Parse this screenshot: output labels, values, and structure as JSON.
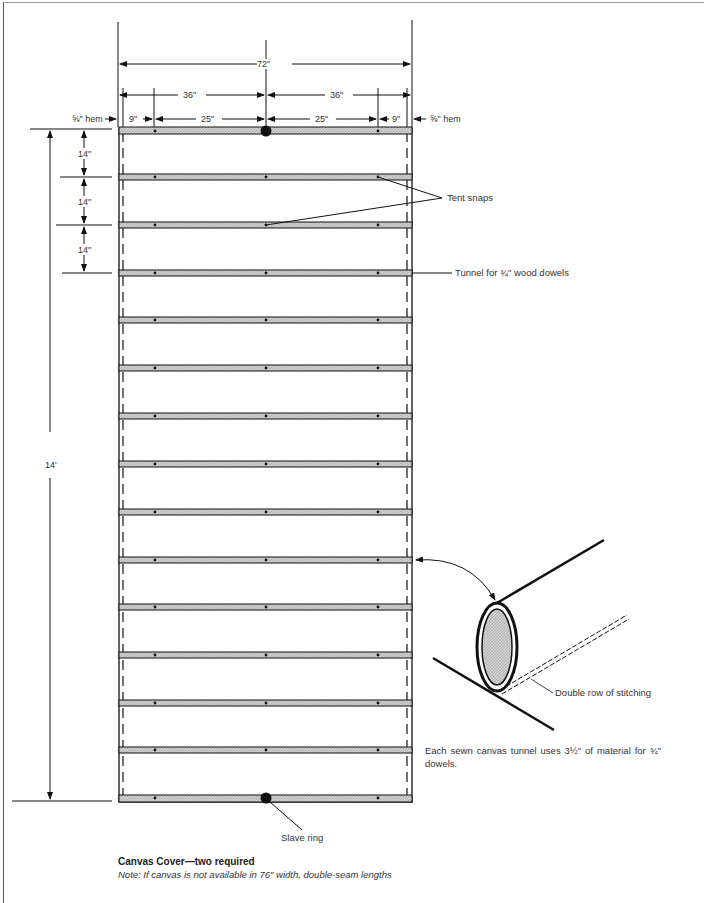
{
  "diagram": {
    "dimensions": {
      "total_width": "72\"",
      "half_left": "36\"",
      "half_right": "36\"",
      "seg_9_left": "9\"",
      "seg_25_left": "25\"",
      "seg_25_right": "25\"",
      "seg_9_right": "9\"",
      "hem_left": "⅝\" hem",
      "hem_right": "⅝\" hem",
      "spacing_1": "14\"",
      "spacing_2": "14\"",
      "spacing_3": "14\"",
      "total_length": "14'"
    },
    "callouts": {
      "tent_snaps": "Tent snaps",
      "tunnel": "Tunnel for ¾\" wood dowels",
      "stitching": "Double row of stitching",
      "slave_ring": "Slave ring"
    },
    "detail_note": "Each sewn canvas tunnel uses 3½\" of material for ¾\" dowels.",
    "tunnel_count": 15,
    "colors": {
      "line": "#111111",
      "tunnel_fill": "#c8c8c8",
      "paper": "#ffffff"
    }
  },
  "caption": {
    "title": "Canvas Cover—two required",
    "note": "Note: If canvas is not available in 76\" width, double-seam lengths"
  }
}
